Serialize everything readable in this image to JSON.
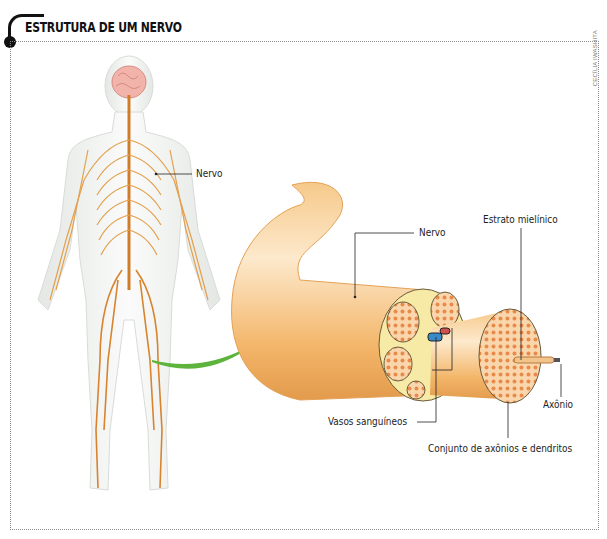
{
  "header": {
    "title": "ESTRUTURA DE UM NERVO"
  },
  "credit": "CECÍLIA IWASHITA",
  "labels": {
    "body_nerve": "Nervo",
    "nerve": "Nervo",
    "myelin": "Estrato mielínico",
    "blood_vessels": "Vasos sanguíneos",
    "axon": "Axônio",
    "bundle": "Conjunto de axônios e dendritos"
  },
  "colors": {
    "nerve_orange": "#e8a04a",
    "nerve_light": "#f9d9a8",
    "arrow_green": "#5cb43c",
    "brain_pink": "#f0b0a8",
    "body_fill": "#eef0ee"
  }
}
